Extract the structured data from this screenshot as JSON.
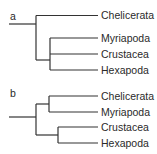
{
  "trees": [
    {
      "panel_label": "a",
      "taxa": [
        "Chelicerata",
        "Myriapoda",
        "Crustacea",
        "Hexapoda"
      ],
      "topology": "(Chelicerata,(Myriapoda,Crustacea,Hexapoda))"
    },
    {
      "panel_label": "b",
      "taxa": [
        "Chelicerata",
        "Myriapoda",
        "Crustacea",
        "Hexapoda"
      ],
      "topology": "((Chelicerata,Myriapoda),(Crustacea,Hexapoda))"
    }
  ],
  "colors": {
    "line": "#333333",
    "text": "#2a2a2a"
  }
}
